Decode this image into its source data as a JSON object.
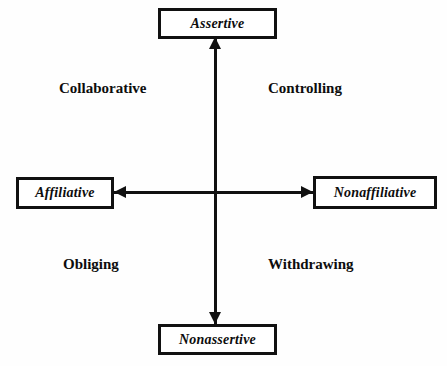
{
  "diagram": {
    "type": "two-axis quadrant model",
    "background_color": "#fefefe",
    "line_color": "#111111",
    "text_color": "#0d0d0d",
    "axes": [
      {
        "name": "vertical-axis",
        "orientation": "vertical",
        "top_pole": "Assertive",
        "bottom_pole": "Nonassertive",
        "arrowheads": [
          "up",
          "down"
        ]
      },
      {
        "name": "horizontal-axis",
        "orientation": "horizontal",
        "left_pole": "Affiliative",
        "right_pole": "Nonaffiliative",
        "arrowheads": [
          "left",
          "right"
        ]
      }
    ],
    "nodes": {
      "top": "Assertive",
      "left": "Affiliative",
      "right": "Nonaffiliative",
      "bottom": "Nonassertive"
    },
    "quadrants": {
      "top_left": "Collaborative",
      "top_right": "Controlling",
      "bottom_left": "Obliging",
      "bottom_right": "Withdrawing"
    }
  }
}
